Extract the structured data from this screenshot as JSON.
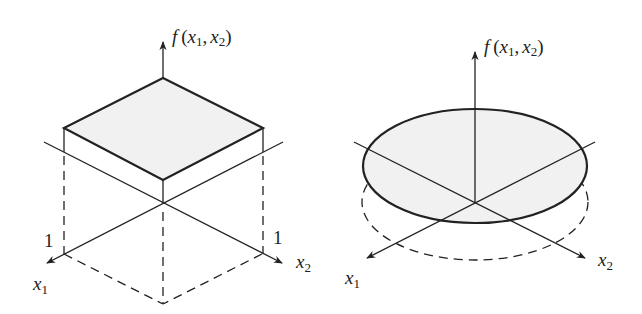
{
  "figure": {
    "colors": {
      "stroke": "#222222",
      "fill": "#f1f1f1",
      "background": "#ffffff"
    },
    "left_panel": {
      "name": "uniform-square-density",
      "axis_labels": {
        "vertical": {
          "fn": "f",
          "open": "(",
          "v1": "x",
          "s1": "1",
          "comma": ",",
          "v2": "x",
          "s2": "2",
          "close": ")"
        },
        "x1": {
          "var": "x",
          "sub": "1"
        },
        "x2": {
          "var": "x",
          "sub": "2"
        }
      },
      "tick_labels": {
        "x1_tick": "1",
        "x2_tick": "1"
      },
      "shape": "square (plateau of height f over unit square)"
    },
    "right_panel": {
      "name": "uniform-disk-density",
      "axis_labels": {
        "vertical": {
          "fn": "f",
          "open": "(",
          "v1": "x",
          "s1": "1",
          "comma": ",",
          "v2": "x",
          "s2": "2",
          "close": ")"
        },
        "x1": {
          "var": "x",
          "sub": "1"
        },
        "x2": {
          "var": "x",
          "sub": "2"
        }
      },
      "shape": "disk (plateau of height f over circular region)"
    }
  }
}
